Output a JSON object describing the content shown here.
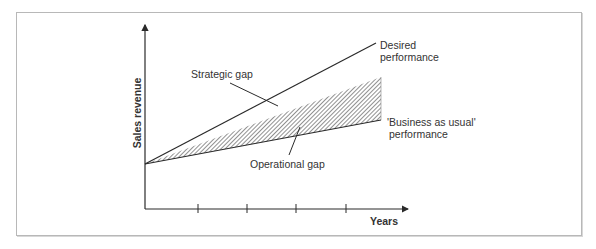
{
  "chart_data": {
    "type": "line",
    "title": "",
    "xlabel": "Years",
    "ylabel": "Sales revenue",
    "x_ticks": 4,
    "series": [
      {
        "name": "Desired performance",
        "label_lines": [
          "Desired",
          "performance"
        ],
        "start": 0.0,
        "end": 1.0
      },
      {
        "name": "'Business as usual' performance",
        "label_lines": [
          "'Business as usual'",
          "performance"
        ],
        "start": 0.0,
        "end": 0.38
      }
    ],
    "regions": [
      {
        "name": "Operational gap",
        "kind": "hatched",
        "upper_end": 0.72,
        "lower_end": 0.38
      },
      {
        "name": "Strategic gap",
        "kind": "unshaded",
        "upper_end": 1.0,
        "lower_end": 0.72
      }
    ],
    "annotations": [
      "Strategic gap",
      "Operational gap"
    ]
  },
  "colors": {
    "line": "#2a2a2a",
    "hatch": "#555555",
    "frame": "#b8b8b8",
    "text": "#333333"
  }
}
